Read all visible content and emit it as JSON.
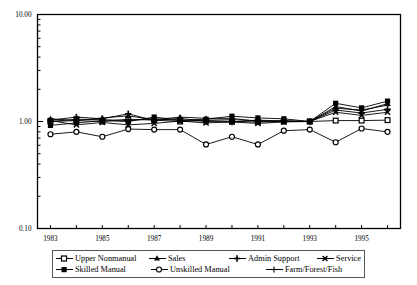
{
  "chart_data": {
    "type": "line",
    "title": "",
    "xlabel": "",
    "ylabel": "",
    "yscale": "log",
    "ylim": [
      0.1,
      10.0
    ],
    "ytick_labels": [
      "10.00",
      "1.00",
      "0.10"
    ],
    "ytick_values": [
      10.0,
      1.0,
      0.1
    ],
    "grid": false,
    "legend_position": "bottom",
    "x": [
      1983,
      1984,
      1985,
      1986,
      1987,
      1988,
      1989,
      1990,
      1991,
      1992,
      1993,
      1994,
      1995,
      1996
    ],
    "xtick_labels": [
      "1983",
      "",
      "1985",
      "",
      "1987",
      "",
      "1989",
      "",
      "1991",
      "",
      "1993",
      "",
      "1995",
      ""
    ],
    "series": [
      {
        "name": "Upper Nonmanual",
        "marker": "open-square",
        "values": [
          1.0,
          1.02,
          1.0,
          1.05,
          1.03,
          1.0,
          1.02,
          1.0,
          0.99,
          1.0,
          1.0,
          1.02,
          1.02,
          1.03
        ]
      },
      {
        "name": "Sales",
        "marker": "filled-triangle",
        "values": [
          1.06,
          1.02,
          1.08,
          1.13,
          1.04,
          1.1,
          1.07,
          1.07,
          1.0,
          1.02,
          1.0,
          1.38,
          1.25,
          1.47
        ]
      },
      {
        "name": "Admin Support",
        "marker": "plus-filled",
        "values": [
          1.03,
          1.1,
          1.06,
          1.18,
          1.02,
          1.07,
          1.0,
          0.99,
          1.03,
          1.01,
          1.0,
          1.28,
          1.2,
          1.3
        ]
      },
      {
        "name": "Service",
        "marker": "cross-x",
        "values": [
          1.02,
          0.93,
          0.98,
          0.93,
          0.96,
          1.01,
          0.97,
          0.99,
          0.96,
          0.99,
          1.0,
          1.22,
          1.14,
          1.22
        ]
      },
      {
        "name": "Skilled Manual",
        "marker": "filled-square",
        "values": [
          0.92,
          0.97,
          1.02,
          1.0,
          1.1,
          1.03,
          1.05,
          1.12,
          1.08,
          1.06,
          1.0,
          1.48,
          1.34,
          1.55
        ]
      },
      {
        "name": "Unskilled Manual",
        "marker": "open-circle",
        "values": [
          0.76,
          0.8,
          0.72,
          0.85,
          0.84,
          0.84,
          0.61,
          0.72,
          0.61,
          0.82,
          0.84,
          0.64,
          0.86,
          0.8
        ]
      },
      {
        "name": "Farm/Forest/Fish",
        "marker": "plus-thin",
        "values": [
          1.0,
          1.05,
          1.04,
          1.02,
          1.06,
          1.02,
          1.03,
          1.04,
          1.02,
          1.0,
          1.0,
          1.33,
          1.28,
          1.42
        ]
      }
    ]
  },
  "axes": {
    "ytick_labels": [
      "10.00",
      "1.00",
      "0.10"
    ],
    "xtick_labels": [
      "1983",
      "1985",
      "1987",
      "1989",
      "1991",
      "1993",
      "1995"
    ]
  },
  "legend": {
    "row1": [
      {
        "label": "Upper Nonmanual",
        "marker": "open-square"
      },
      {
        "label": "Sales",
        "marker": "filled-triangle"
      },
      {
        "label": "Admin Support",
        "marker": "plus-filled"
      },
      {
        "label": "Service",
        "marker": "cross-x"
      }
    ],
    "row2": [
      {
        "label": "Skilled Manual",
        "marker": "filled-square"
      },
      {
        "label": "Unskilled Manual",
        "marker": "open-circle"
      },
      {
        "label": "Farm/Forest/Fish",
        "marker": "plus-thin"
      }
    ]
  },
  "colors": {
    "line": "#000000",
    "axis": "#000000",
    "background": "#ffffff",
    "legend_border": "#555555"
  }
}
